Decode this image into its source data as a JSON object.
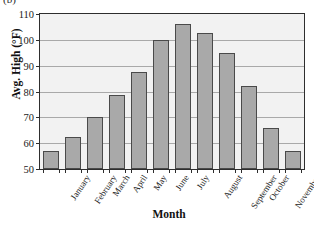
{
  "figure": {
    "panel_letter": "(b)"
  },
  "chart_data": {
    "type": "bar",
    "title": "",
    "xlabel": "Month",
    "ylabel": "Avg. High (°F)",
    "categories": [
      "January",
      "February",
      "March",
      "April",
      "May",
      "June",
      "July",
      "August",
      "September",
      "October",
      "November",
      "December"
    ],
    "values": [
      57,
      62.5,
      70,
      78.5,
      87.5,
      100,
      106,
      102.5,
      95,
      82,
      66,
      57
    ],
    "ylim": [
      50,
      110
    ],
    "yticks": [
      50,
      60,
      70,
      80,
      90,
      100,
      110
    ],
    "ytick_labels": [
      "50",
      "60",
      "70",
      "80",
      "90",
      "100",
      "110"
    ],
    "grid": true,
    "legend": "none",
    "bar_color": "#a9a9a9",
    "bar_edge_color": "#4a4a4a",
    "plot_background": "#f2f2f2",
    "axis_color": "#2e2e2e"
  }
}
